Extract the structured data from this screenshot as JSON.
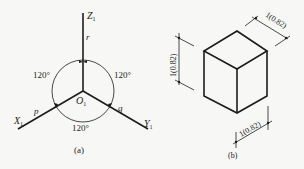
{
  "figure_a": {
    "caption": "(a)",
    "axes": {
      "z": {
        "name": "Z",
        "sub": "1",
        "coef": "r"
      },
      "x": {
        "name": "X",
        "sub": "1",
        "coef": "p"
      },
      "y": {
        "name": "Y",
        "sub": "1",
        "coef": "q"
      }
    },
    "origin": {
      "name": "O",
      "sub": "1"
    },
    "angles": {
      "left": "120°",
      "right": "120°",
      "bottom": "120°"
    }
  },
  "figure_b": {
    "caption": "(b)",
    "dimensions": {
      "top_right": "1(0.82)",
      "left": "1(0.82)",
      "bottom": "1(0.82)"
    }
  },
  "colors": {
    "line": "#1c1c1c",
    "background": "#f7f7f5"
  }
}
